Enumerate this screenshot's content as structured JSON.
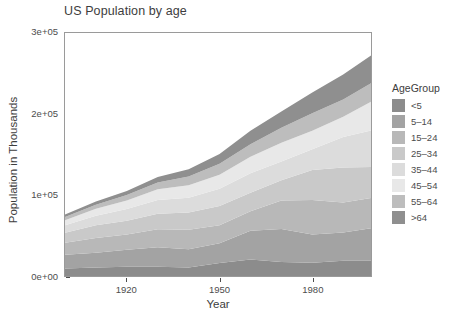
{
  "chart_data": {
    "type": "area",
    "stacked": true,
    "title": "US Population by age",
    "xlabel": "Year",
    "ylabel": "Population in Thousands",
    "xlim": [
      1900,
      1999
    ],
    "ylim": [
      0,
      300000
    ],
    "grid": false,
    "legend_position": "right",
    "legend_title": "AgeGroup",
    "xticks": [
      1920,
      1950,
      1980
    ],
    "xtick_labels": [
      "1920",
      "1950",
      "1980"
    ],
    "yticks": [
      0,
      100000,
      200000,
      300000
    ],
    "ytick_labels": [
      "0e+00",
      "1e+05",
      "2e+05",
      "3e+05"
    ],
    "x": [
      1900,
      1910,
      1920,
      1930,
      1940,
      1950,
      1960,
      1970,
      1980,
      1990,
      1999
    ],
    "series": [
      {
        "name": "<5",
        "color": "#8c8c8c",
        "values": [
          9181,
          10631,
          11573,
          11444,
          10541,
          16163,
          20341,
          17166,
          16348,
          18758,
          18942
        ]
      },
      {
        "name": "5-14",
        "color": "#a3a3a3",
        "values": [
          16966,
          18153,
          20931,
          23953,
          22431,
          24319,
          35465,
          40733,
          34942,
          35095,
          39977
        ]
      },
      {
        "name": "15-24",
        "color": "#b8b8b8",
        "values": [
          14951,
          18121,
          18727,
          22263,
          24033,
          22098,
          24020,
          35441,
          42487,
          37013,
          37486
        ]
      },
      {
        "name": "25-34",
        "color": "#c9c9c9",
        "values": [
          12161,
          15665,
          17137,
          19199,
          21339,
          23759,
          22818,
          24907,
          37082,
          43176,
          38293
        ]
      },
      {
        "name": "35-44",
        "color": "#dcdcdc",
        "values": [
          9273,
          11879,
          14411,
          17119,
          18333,
          21450,
          24081,
          23088,
          25634,
          37579,
          44805
        ]
      },
      {
        "name": "45-54",
        "color": "#e8e8e8",
        "values": [
          6437,
          8420,
          10573,
          13128,
          15512,
          17343,
          20485,
          23220,
          22800,
          25057,
          35524
        ]
      },
      {
        "name": "55-64",
        "color": "#bdbdbd",
        "values": [
          4026,
          5054,
          6532,
          8397,
          10572,
          13370,
          15572,
          18590,
          21703,
          21113,
          23032
        ]
      },
      {
        "name": ">64",
        "color": "#8f8f8f",
        "values": [
          3080,
          3950,
          4933,
          6634,
          9019,
          12270,
          16560,
          20066,
          25549,
          31084,
          34242
        ]
      }
    ]
  },
  "legend": {
    "title": "AgeGroup",
    "items": [
      {
        "label": "<5",
        "color": "#8c8c8c"
      },
      {
        "label": "5–14",
        "color": "#a3a3a3"
      },
      {
        "label": "15–24",
        "color": "#b8b8b8"
      },
      {
        "label": "25–34",
        "color": "#c9c9c9"
      },
      {
        "label": "35–44",
        "color": "#dcdcdc"
      },
      {
        "label": "45–54",
        "color": "#e8e8e8"
      },
      {
        "label": "55–64",
        "color": "#bdbdbd"
      },
      {
        "label": ">64",
        "color": "#8f8f8f"
      }
    ]
  }
}
